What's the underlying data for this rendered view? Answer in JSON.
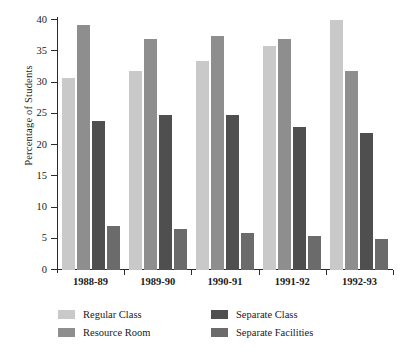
{
  "chart_data": {
    "type": "bar",
    "title": "",
    "subtitle": "",
    "xlabel": "",
    "ylabel": "Percentage of Students",
    "ylim": [
      0,
      40
    ],
    "ytick_values": [
      0,
      5,
      10,
      15,
      20,
      25,
      30,
      35,
      40
    ],
    "ytick_labels": [
      "0",
      "5",
      "10",
      "15",
      "20",
      "25",
      "30",
      "35",
      "40"
    ],
    "grid": false,
    "legend_position": "bottom",
    "categories": [
      "1988-89",
      "1989-90",
      "1990-91",
      "1991-92",
      "1992-93"
    ],
    "series": [
      {
        "name": "Regular Class",
        "color": "#c9c9c9",
        "values": [
          30.8,
          31.8,
          33.4,
          35.9,
          40.0
        ]
      },
      {
        "name": "Resource Room",
        "color": "#8e8e8e",
        "values": [
          39.2,
          37.0,
          37.4,
          36.9,
          31.8
        ]
      },
      {
        "name": "Separate Class",
        "color": "#4f4f4f",
        "values": [
          23.9,
          24.8,
          24.8,
          22.9,
          21.9
        ]
      },
      {
        "name": "Separate Facilities",
        "color": "#6b6b6b",
        "values": [
          7.1,
          6.6,
          6.0,
          5.5,
          5.0
        ]
      }
    ]
  },
  "axis": {
    "y_title": "Percentage of Students"
  },
  "legend": {
    "entries": [
      {
        "label": "Regular Class",
        "color": "#c9c9c9"
      },
      {
        "label": "Separate Class",
        "color": "#4f4f4f"
      },
      {
        "label": "Resource Room",
        "color": "#8e8e8e"
      },
      {
        "label": "Separate Facilities",
        "color": "#6b6b6b"
      }
    ]
  }
}
